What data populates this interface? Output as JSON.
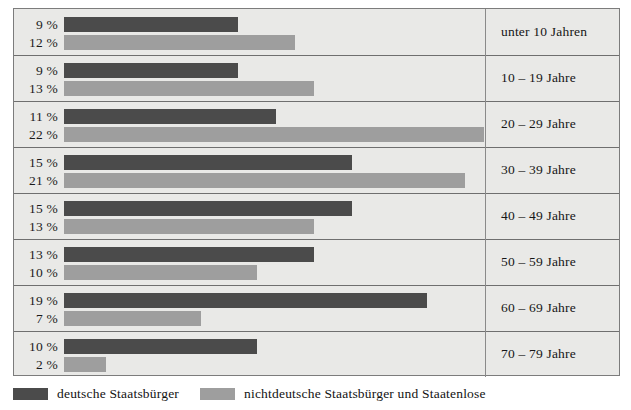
{
  "chart_data": {
    "type": "bar",
    "orientation": "horizontal",
    "title": "",
    "xlabel": "",
    "ylabel": "",
    "categories": [
      "unter 10 Jahren",
      "10 – 19 Jahre",
      "20 – 29 Jahre",
      "30 – 39 Jahre",
      "40 – 49 Jahre",
      "50 – 59 Jahre",
      "60 – 69 Jahre",
      "70 – 79 Jahre"
    ],
    "series": [
      {
        "name": "deutsche Staatsbürger",
        "color": "#4b4b4b",
        "values": [
          9,
          9,
          11,
          15,
          15,
          13,
          19,
          10
        ],
        "value_labels": [
          "9 %",
          "9 %",
          "11 %",
          "15 %",
          "15 %",
          "13 %",
          "19 %",
          "10 %"
        ]
      },
      {
        "name": "nichtdeutsche Staatsbürger und Staatenlose",
        "color": "#9e9e9e",
        "values": [
          12,
          13,
          22,
          21,
          13,
          10,
          7,
          2
        ],
        "value_labels": [
          "12 %",
          "13 %",
          "22 %",
          "21 %",
          "13 %",
          "10 %",
          "7 %",
          "2 %"
        ]
      }
    ],
    "unit": "%",
    "xlim": [
      0,
      22
    ],
    "grid": false,
    "legend_position": "bottom-left"
  },
  "legend": {
    "items": [
      {
        "label": "deutsche Staatsbürger",
        "color": "#4b4b4b"
      },
      {
        "label": "nichtdeutsche Staatsbürger und Staatenlose",
        "color": "#9e9e9e"
      }
    ]
  }
}
